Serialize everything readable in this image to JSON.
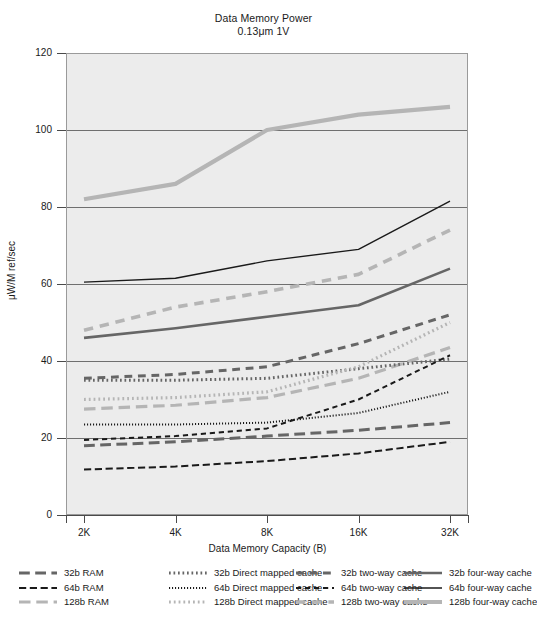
{
  "chart_data": {
    "type": "line",
    "title": "Data Memory Power",
    "subtitle": "0.13μm 1V",
    "xlabel": "Data Memory Capacity (B)",
    "ylabel": "μW/M ref/sec",
    "categories": [
      "2K",
      "4K",
      "8K",
      "16K",
      "32K"
    ],
    "ylim": [
      0,
      120
    ],
    "yticks": [
      0,
      20,
      40,
      60,
      80,
      100,
      120
    ],
    "grid": true,
    "legend_position": "bottom",
    "series": [
      {
        "name": "32b RAM",
        "values": [
          18.0,
          19.0,
          20.5,
          22.0,
          24.0
        ],
        "color": "#666666",
        "style": "longdash",
        "width": 3.0
      },
      {
        "name": "64b RAM",
        "values": [
          11.8,
          12.6,
          14.0,
          16.0,
          19.0
        ],
        "color": "#1a1a1a",
        "style": "longdash",
        "width": 2.0
      },
      {
        "name": "128b RAM",
        "values": [
          27.5,
          28.5,
          30.5,
          35.5,
          43.5
        ],
        "color": "#b5b5b5",
        "style": "longdash",
        "width": 3.2
      },
      {
        "name": "32b Direct mapped cache",
        "values": [
          35.0,
          35.0,
          35.5,
          38.0,
          40.5
        ],
        "color": "#666666",
        "style": "dotted",
        "width": 3.0
      },
      {
        "name": "64b Direct mapped cache",
        "values": [
          23.5,
          23.5,
          24.0,
          26.5,
          32.0
        ],
        "color": "#1a1a1a",
        "style": "dotted",
        "width": 2.0
      },
      {
        "name": "128b Direct mapped cache",
        "values": [
          30.0,
          30.5,
          32.0,
          38.5,
          50.0
        ],
        "color": "#b5b5b5",
        "style": "dotted",
        "width": 3.2
      },
      {
        "name": "32b two-way cache",
        "values": [
          35.5,
          36.5,
          38.5,
          44.5,
          52.0
        ],
        "color": "#666666",
        "style": "dash",
        "width": 3.0
      },
      {
        "name": "64b two-way cache",
        "values": [
          19.5,
          20.5,
          22.5,
          30.0,
          41.5
        ],
        "color": "#1a1a1a",
        "style": "dash",
        "width": 2.0
      },
      {
        "name": "128b two-way cache",
        "values": [
          48.0,
          54.0,
          58.0,
          62.5,
          74.0
        ],
        "color": "#b5b5b5",
        "style": "dash",
        "width": 3.6
      },
      {
        "name": "32b four-way cache",
        "values": [
          46.0,
          48.5,
          51.5,
          54.5,
          64.0
        ],
        "color": "#666666",
        "style": "solid",
        "width": 2.6
      },
      {
        "name": "64b four-way cache",
        "values": [
          60.5,
          61.5,
          66.0,
          69.0,
          81.5
        ],
        "color": "#1a1a1a",
        "style": "solid",
        "width": 1.4
      },
      {
        "name": "128b four-way cache",
        "values": [
          82.0,
          86.0,
          100.0,
          104.0,
          106.0
        ],
        "color": "#b5b5b5",
        "style": "solid",
        "width": 4.2
      }
    ]
  },
  "legend": {
    "columns": [
      {
        "entries": [
          {
            "label": "32b RAM",
            "series_index": 0
          },
          {
            "label": "64b RAM",
            "series_index": 1
          },
          {
            "label": "128b RAM",
            "series_index": 2
          }
        ]
      },
      {
        "entries": [
          {
            "label": "32b Direct mapped cache",
            "series_index": 3
          },
          {
            "label": "64b Direct mapped cache",
            "series_index": 4
          },
          {
            "label": "128b Direct mapped cache",
            "series_index": 5
          }
        ]
      },
      {
        "entries": [
          {
            "label": "32b two-way cache",
            "series_index": 6
          },
          {
            "label": "64b two-way cache",
            "series_index": 7
          },
          {
            "label": "128b two-way cache",
            "series_index": 8
          }
        ]
      },
      {
        "entries": [
          {
            "label": "32b four-way cache",
            "series_index": 9
          },
          {
            "label": "64b four-way cache",
            "series_index": 10
          },
          {
            "label": "128b four-way cache",
            "series_index": 11
          }
        ]
      }
    ]
  },
  "colors": {
    "plot_background": "#ececec",
    "frame": "#9a9a9a",
    "gridline": "#6f6f6f",
    "text": "#1a1a1a",
    "width_32b": "#666666",
    "width_64b": "#1a1a1a",
    "width_128b": "#b5b5b5"
  }
}
